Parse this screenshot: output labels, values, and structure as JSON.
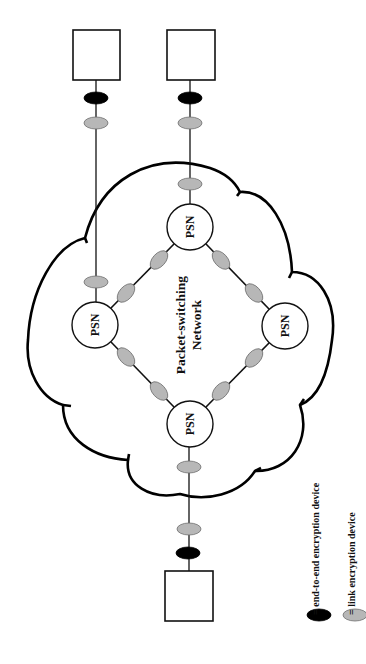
{
  "diagram": {
    "network_label_line1": "Packet-switching",
    "network_label_line2": "Network",
    "psn_label": "PSN",
    "psns": [
      {
        "id": "top",
        "label": "PSN",
        "cx": 190,
        "cy": 227
      },
      {
        "id": "left",
        "label": "PSN",
        "cx": 95,
        "cy": 325
      },
      {
        "id": "right",
        "label": "PSN",
        "cx": 285,
        "cy": 326
      },
      {
        "id": "bottom",
        "label": "PSN",
        "cx": 190,
        "cy": 424
      }
    ],
    "hosts": [
      {
        "id": "host-top-left",
        "x": 73,
        "y": 30,
        "w": 47,
        "h": 50
      },
      {
        "id": "host-top-right",
        "x": 167,
        "y": 30,
        "w": 48,
        "h": 50
      },
      {
        "id": "host-bottom",
        "x": 165,
        "y": 571,
        "w": 48,
        "h": 50
      }
    ],
    "device_types": {
      "end_to_end": "end-to-end encryption device",
      "link": "link encryption device"
    }
  },
  "legend": {
    "items": [
      {
        "symbol": "black-ellipse",
        "label": "= end-to-end encryption device"
      },
      {
        "symbol": "gray-ellipse",
        "label": "= link encryption device"
      }
    ]
  },
  "colors": {
    "end_to_end_device": "#000000",
    "link_device": "#b7b7b7",
    "outline": "#111111",
    "background": "#ffffff"
  }
}
